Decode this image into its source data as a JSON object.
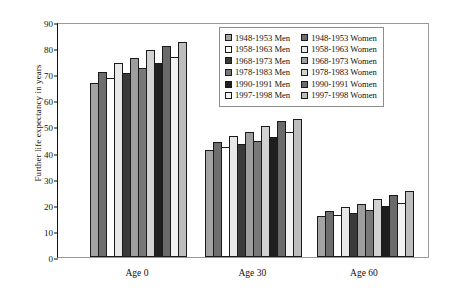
{
  "chart_data": {
    "type": "bar",
    "title": "",
    "xlabel": "",
    "ylabel": "Further life expectancy in years",
    "categories": [
      "Age 0",
      "Age 30",
      "Age 60"
    ],
    "ylim": [
      0,
      90
    ],
    "yticks": [
      0,
      10,
      20,
      30,
      40,
      50,
      60,
      70,
      80,
      90
    ],
    "grid": false,
    "legend_position": "top-right",
    "series": [
      {
        "name": "1948-1953 Men",
        "color": "#a3a3a3",
        "values": [
          66.5,
          41.0,
          15.6
        ]
      },
      {
        "name": "1948-1953 Women",
        "color": "#6e6e6e",
        "values": [
          71.0,
          44.2,
          17.8
        ]
      },
      {
        "name": "1958-1963 Men",
        "color": "#ffffff",
        "values": [
          68.7,
          42.0,
          16.0
        ]
      },
      {
        "name": "1958-1963 Women",
        "color": "#e8e8e8",
        "values": [
          74.2,
          46.3,
          19.2
        ]
      },
      {
        "name": "1968-1973 Men",
        "color": "#3a3a3a",
        "values": [
          70.3,
          43.2,
          16.8
        ]
      },
      {
        "name": "1968-1973 Women",
        "color": "#9e9e9e",
        "values": [
          76.2,
          48.0,
          20.4
        ]
      },
      {
        "name": "1978-1983 Men",
        "color": "#787878",
        "values": [
          72.5,
          44.5,
          18.0
        ]
      },
      {
        "name": "1978-1983 Women",
        "color": "#d2d2d2",
        "values": [
          79.2,
          50.2,
          22.3
        ]
      },
      {
        "name": "1990-1991 Men",
        "color": "#1f1f1f",
        "values": [
          74.2,
          46.0,
          19.4
        ]
      },
      {
        "name": "1990-1991 Women",
        "color": "#6a6a6a",
        "values": [
          81.0,
          52.0,
          23.9
        ]
      },
      {
        "name": "1997-1998 Men",
        "color": "#f2f2f2",
        "values": [
          76.5,
          47.8,
          20.6
        ]
      },
      {
        "name": "1997-1998 Women",
        "color": "#bdbdbd",
        "values": [
          82.5,
          52.8,
          25.1
        ]
      }
    ]
  },
  "legend": {
    "columns": [
      [
        "1948-1953 Men",
        "1958-1963 Men",
        "1968-1973 Men",
        "1978-1983 Men",
        "1990-1991 Men",
        "1997-1998 Men"
      ],
      [
        "1948-1953 Women",
        "1958-1963 Women",
        "1968-1973 Women",
        "1978-1983 Women",
        "1990-1991 Women",
        "1997-1998 Women"
      ]
    ]
  }
}
